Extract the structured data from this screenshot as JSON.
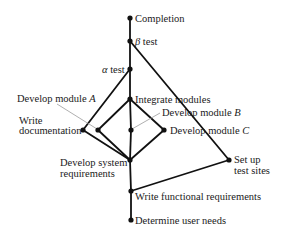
{
  "diagram": {
    "type": "activity-network",
    "nodes": [
      {
        "id": "completion",
        "label": "Completion",
        "x": 130,
        "y": 18
      },
      {
        "id": "beta_test",
        "label_prefix": "β",
        "label": " test",
        "x": 130,
        "y": 41
      },
      {
        "id": "alpha_test",
        "label_prefix": "α",
        "label": " test",
        "x": 130,
        "y": 69
      },
      {
        "id": "integrate_modules",
        "label": "Integrate modules",
        "x": 130,
        "y": 99
      },
      {
        "id": "write_documentation",
        "label_line1": "Write",
        "label_line2": "documentation",
        "x": 83,
        "y": 130
      },
      {
        "id": "develop_module_a",
        "label": "Develop module ",
        "label_italic": "A",
        "x": 98,
        "y": 130
      },
      {
        "id": "develop_module_b",
        "label": "Develop module ",
        "label_italic": "B",
        "x": 131,
        "y": 130
      },
      {
        "id": "develop_module_c",
        "label": "Develop module ",
        "label_italic": "C",
        "x": 164,
        "y": 130
      },
      {
        "id": "develop_system_requirements",
        "label_line1": "Develop system",
        "label_line2": "requirements",
        "x": 130,
        "y": 160
      },
      {
        "id": "set_up_test_sites",
        "label_line1": "Set up",
        "label_line2": "test sites",
        "x": 229,
        "y": 160
      },
      {
        "id": "write_functional_requirements",
        "label": "Write functional requirements",
        "x": 131,
        "y": 191
      },
      {
        "id": "determine_user_needs",
        "label": "Determine user needs",
        "x": 131,
        "y": 220
      }
    ],
    "edges": [
      [
        "completion",
        "beta_test"
      ],
      [
        "beta_test",
        "alpha_test"
      ],
      [
        "beta_test",
        "set_up_test_sites"
      ],
      [
        "alpha_test",
        "integrate_modules"
      ],
      [
        "alpha_test",
        "write_documentation"
      ],
      [
        "integrate_modules",
        "develop_module_a"
      ],
      [
        "integrate_modules",
        "develop_module_b"
      ],
      [
        "integrate_modules",
        "develop_module_c"
      ],
      [
        "write_documentation",
        "develop_system_requirements"
      ],
      [
        "develop_module_a",
        "develop_system_requirements"
      ],
      [
        "develop_module_b",
        "develop_system_requirements"
      ],
      [
        "develop_module_c",
        "develop_system_requirements"
      ],
      [
        "develop_system_requirements",
        "write_functional_requirements"
      ],
      [
        "set_up_test_sites",
        "write_functional_requirements"
      ],
      [
        "write_functional_requirements",
        "determine_user_needs"
      ]
    ]
  },
  "labels": {
    "completion": "Completion",
    "beta_symbol": "β",
    "beta_text": " test",
    "alpha_symbol": "α",
    "alpha_text": " test",
    "integrate_modules": "Integrate modules",
    "develop_module_a_text": "Develop module ",
    "develop_module_a_var": "A",
    "develop_module_b_text": "Develop module ",
    "develop_module_b_var": "B",
    "develop_module_c_text": "Develop module ",
    "develop_module_c_var": "C",
    "write_documentation_1": "Write",
    "write_documentation_2": "documentation",
    "develop_system_requirements_1": "Develop system",
    "develop_system_requirements_2": "requirements",
    "set_up_test_sites_1": "Set up",
    "set_up_test_sites_2": "test sites",
    "write_functional_requirements": "Write functional requirements",
    "determine_user_needs": "Determine user needs"
  },
  "colors": {
    "edge": "#111111",
    "leader": "#9a9a9a",
    "text": "#1a1a1a",
    "background": "#ffffff"
  }
}
